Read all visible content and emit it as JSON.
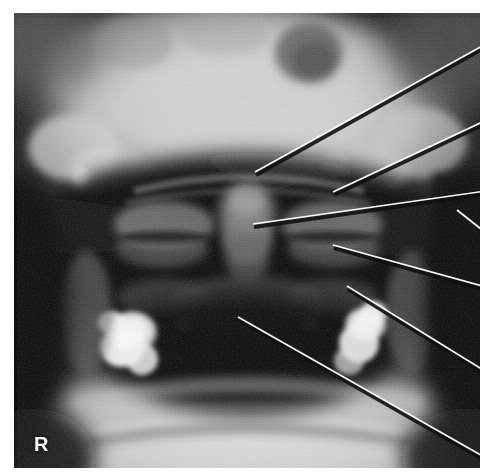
{
  "image": {
    "kind": "radiograph",
    "modality": "plain-film-xray",
    "view": "open-mouth anteroposterior (odontoid) projection",
    "region": "skull base, upper cervical spine and mandible",
    "frame": {
      "x": 14,
      "y": 13,
      "width": 466,
      "height": 455
    },
    "background_color": "#ffffff",
    "film_black": "#070707",
    "film_white": "#f2f2f2"
  },
  "markers": [
    {
      "id": "side-marker",
      "label": "R",
      "meaning": "right side of patient",
      "color": "#fdfdfd",
      "x": 34,
      "y": 434
    }
  ],
  "leader_lines": {
    "stroke_color": "#fafafa",
    "shadow_color": "#111111",
    "stroke_width": 1.7,
    "count": 7,
    "lines": [
      {
        "id": "leader-1",
        "x1": 255,
        "y1": 172,
        "x2": 493,
        "y2": 40,
        "tip": "upper-midline-structure"
      },
      {
        "id": "leader-2",
        "x1": 333,
        "y1": 192,
        "x2": 493,
        "y2": 117,
        "tip": "right-lateral-mass-superior"
      },
      {
        "id": "leader-3",
        "x1": 253,
        "y1": 224,
        "x2": 493,
        "y2": 190,
        "tip": "odontoid-process-midline"
      },
      {
        "id": "leader-4",
        "x1": 457,
        "y1": 210,
        "x2": 481,
        "y2": 229,
        "tip": "lateral-soft-tissue-edge"
      },
      {
        "id": "leader-5",
        "x1": 333,
        "y1": 245,
        "x2": 493,
        "y2": 289,
        "tip": "right-atlanto-axial-joint"
      },
      {
        "id": "leader-6",
        "x1": 347,
        "y1": 286,
        "x2": 493,
        "y2": 376,
        "tip": "right-lateral-mass-inferior"
      },
      {
        "id": "leader-7",
        "x1": 238,
        "y1": 317,
        "x2": 493,
        "y2": 462,
        "tip": "axis-vertebral-body"
      }
    ]
  },
  "anatomy_regions": [
    {
      "id": "skull-base",
      "description": "bright dome of skull base / hard palate across upper film"
    },
    {
      "id": "nasal-air-shadow",
      "description": "dark radiolucent band beneath palate"
    },
    {
      "id": "odontoid-process",
      "description": "central vertical dens shadow"
    },
    {
      "id": "lateral-mass-left",
      "description": "left lateral mass of C1"
    },
    {
      "id": "lateral-mass-right",
      "description": "right lateral mass of C1"
    },
    {
      "id": "mandible",
      "description": "bright arch of mandible across lower film"
    },
    {
      "id": "dental-restoration-right",
      "description": "very bright amalgam/metal restoration, lower left of film (patient right)"
    },
    {
      "id": "dental-restoration-left",
      "description": "very bright amalgam/metal restoration, lower right of film (patient left)"
    },
    {
      "id": "orbit-shadow",
      "description": "dark rounded orbital shadow top area"
    }
  ]
}
